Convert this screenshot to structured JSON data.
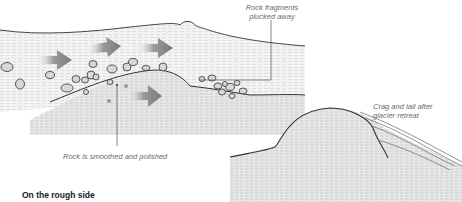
{
  "diagram": {
    "labels": {
      "plucked": "Rock fragments plucked away",
      "plucked_line1": "Rock fragments",
      "plucked_line2": "plucked away",
      "smoothed": "Rock is smoothed and polished",
      "crag_line1": "Crag and tail after",
      "crag_line2": "glacier retreat"
    },
    "section_heading": "On the rough side",
    "colors": {
      "arrow": "#8a8a8a",
      "outline": "#3a3a3a",
      "label": "#6a6a6a",
      "ice_fill": "#f1f1f1",
      "rock_fill": "#e4e4e4"
    }
  }
}
